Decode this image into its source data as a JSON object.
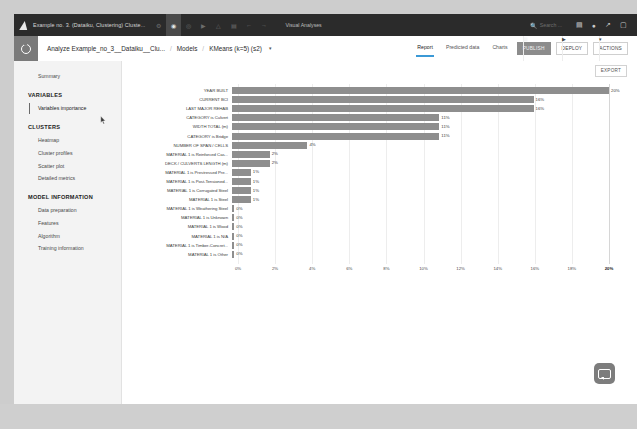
{
  "window": {
    "title": "Example no. 3. (Dataiku, Clustering) Cluste...",
    "app_section": "Visual Analyses",
    "search_placeholder": "Search ...",
    "icons": {
      "logo": "dataiku-logo-icon",
      "flow": "flow-icon",
      "dataset": "dataset-icon",
      "recipe": "recipe-icon",
      "play": "play-icon",
      "warning": "warning-icon",
      "grid": "grid-icon",
      "undo": "undo-icon",
      "redo": "redo-icon",
      "search": "search-icon",
      "calendar": "calendar-icon",
      "help": "help-icon",
      "chart": "chart-icon",
      "user": "user-icon"
    }
  },
  "breadcrumb": {
    "items": [
      {
        "label": "Analyze Example_no_3__Dataiku__Clu..."
      },
      {
        "label": "Models"
      },
      {
        "label": "KMeans (k=5) (s2)"
      }
    ],
    "separator": "/",
    "caret": "▾"
  },
  "tabs": [
    {
      "label": "Report",
      "selected": true
    },
    {
      "label": "Predicted data",
      "selected": false
    },
    {
      "label": "Charts",
      "selected": false
    }
  ],
  "actions": {
    "publish": "PUBLISH",
    "publish_icon": "publish-icon",
    "deploy": "DEPLOY",
    "deploy_icon": "play-icon",
    "actions": "ACTIONS",
    "actions_caret": "▾",
    "export": "EXPORT"
  },
  "sidebar": {
    "summary": "Summary",
    "groups": [
      {
        "heading": "VARIABLES",
        "items": [
          {
            "label": "Variables importance",
            "active": true
          }
        ]
      },
      {
        "heading": "CLUSTERS",
        "items": [
          {
            "label": "Heatmap",
            "active": false
          },
          {
            "label": "Cluster profiles",
            "active": false
          },
          {
            "label": "Scatter plot",
            "active": false
          },
          {
            "label": "Detailed metrics",
            "active": false
          }
        ]
      },
      {
        "heading": "MODEL INFORMATION",
        "items": [
          {
            "label": "Data preparation",
            "active": false
          },
          {
            "label": "Features",
            "active": false
          },
          {
            "label": "Algorithm",
            "active": false
          },
          {
            "label": "Training information",
            "active": false
          }
        ]
      }
    ]
  },
  "chart_data": {
    "type": "bar",
    "orientation": "horizontal",
    "title": "",
    "xlabel": "",
    "ylabel": "",
    "xlim": [
      0,
      20
    ],
    "grid": true,
    "legend": false,
    "bar_color": "#8e8e8e",
    "categories": [
      "YEAR BUILT",
      "CURRENT BCI",
      "LAST MAJOR REHAB",
      "CATEGORY is Culvert",
      "WIDTH TOTAL (m)",
      "CATEGORY is Bridge",
      "NUMBER OF SPAN / CELLS",
      "MATERIAL 1 is Reinforced Cas...",
      "DECK / CULVERTS LENGTH (m)",
      "MATERIAL 1 is Prestressed Pre...",
      "MATERIAL 1 is Post-Tensioned...",
      "MATERIAL 1 is Corrugated Steel",
      "MATERIAL 1 is Steel",
      "MATERIAL 1 is Weathering Steel",
      "MATERIAL 1 is Unknown",
      "MATERIAL 1 is Wood",
      "MATERIAL 1 is N/A",
      "MATERIAL 1 is Timber-Concret...",
      "MATERIAL 1 is Other"
    ],
    "values": [
      20,
      16,
      16,
      11,
      11,
      11,
      4,
      2,
      2,
      1,
      1,
      1,
      1,
      0,
      0,
      0,
      0,
      0,
      0
    ],
    "value_labels": [
      "20%",
      "16%",
      "16%",
      "11%",
      "11%",
      "11%",
      "4%",
      "2%",
      "2%",
      "1%",
      "1%",
      "1%",
      "1%",
      "0%",
      "0%",
      "0%",
      "0%",
      "0%",
      "0%"
    ],
    "xticks": [
      0,
      2,
      4,
      6,
      8,
      10,
      12,
      14,
      16,
      18,
      20
    ],
    "xtick_labels": [
      "0%",
      "2%",
      "4%",
      "6%",
      "8%",
      "10%",
      "12%",
      "14%",
      "16%",
      "18%",
      "20%"
    ]
  },
  "widgets": {
    "chat_icon": "chat-bubble-icon"
  }
}
